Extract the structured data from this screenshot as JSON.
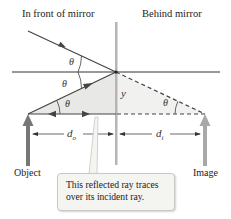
{
  "regions": {
    "front": "In front of mirror",
    "behind": "Behind mirror"
  },
  "symbols": {
    "theta": "θ",
    "y": "y",
    "d_o": {
      "base": "d",
      "sub": "o"
    },
    "d_i": {
      "base": "d",
      "sub": "i"
    }
  },
  "labels": {
    "object": "Object",
    "image": "Image"
  },
  "callout": {
    "line1": "This reflected ray traces",
    "line2": "over its incident ray."
  },
  "colors": {
    "ray": "#555555",
    "mirror": "#b5b5b5",
    "shade": "#e8e8e6",
    "object_arrow": "#777777",
    "image_arrow": "#a8a8a8"
  }
}
